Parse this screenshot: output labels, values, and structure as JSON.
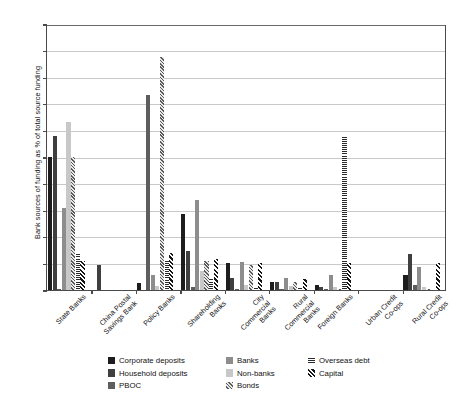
{
  "chart_data": {
    "type": "bar",
    "title": "",
    "xlabel": "",
    "ylabel": "Bank sources of funding as % of total source funding",
    "ylim": [
      0,
      10
    ],
    "yticks": [
      0,
      1,
      2,
      3,
      4,
      5,
      6,
      7,
      8,
      9,
      10
    ],
    "ytick_labels": [
      "0",
      "1",
      "2",
      "3",
      "4",
      "5",
      "6",
      "7",
      "8",
      "9",
      "10"
    ],
    "grid": true,
    "legend_position": "bottom",
    "categories": [
      "State Banks",
      "China Postal Savings Bank",
      "Policy Banks",
      "Shareholding Banks",
      "City Commercial Banks",
      "Rural Commercial Banks",
      "Foreign Banks",
      "Urban Credit Co-ops",
      "Rural Credit Co-ops"
    ],
    "series": [
      {
        "name": "Corporate deposits",
        "color": "#1d1d1d",
        "pattern": "solid",
        "values": [
          5.0,
          0.0,
          0.25,
          2.85,
          1.0,
          0.3,
          0.2,
          0.0,
          0.55
        ]
      },
      {
        "name": "Household deposits",
        "color": "#3f3f3f",
        "pattern": "solid",
        "values": [
          5.8,
          0.95,
          0.0,
          1.45,
          0.45,
          0.3,
          0.1,
          0.0,
          1.35
        ]
      },
      {
        "name": "PBOC",
        "color": "#5e5e5e",
        "pattern": "solid",
        "values": [
          0.05,
          0.0,
          7.35,
          0.1,
          0.05,
          0.05,
          0.05,
          0.0,
          0.2
        ]
      },
      {
        "name": "Banks",
        "color": "#8d8d8d",
        "pattern": "solid",
        "values": [
          3.1,
          0.0,
          0.55,
          3.4,
          1.05,
          0.45,
          0.55,
          0.0,
          0.85
        ]
      },
      {
        "name": "Non-banks",
        "color": "#c8c8c8",
        "pattern": "solid",
        "values": [
          6.3,
          0.0,
          0.15,
          0.7,
          0.2,
          0.15,
          0.1,
          0.0,
          0.1
        ]
      },
      {
        "name": "Bonds",
        "color": "#5a5a5a",
        "pattern": "diagonal-stripe",
        "values": [
          5.0,
          0.0,
          8.75,
          1.1,
          0.95,
          0.3,
          0.05,
          0.0,
          0.05
        ]
      },
      {
        "name": "Overseas debt",
        "color": "#2a2a2a",
        "pattern": "horizontal-stripe",
        "values": [
          1.35,
          0.0,
          1.1,
          0.45,
          0.1,
          0.1,
          5.8,
          0.0,
          0.05
        ]
      },
      {
        "name": "Capital",
        "color": "#161616",
        "pattern": "diagonal-stripe-bold",
        "values": [
          1.1,
          0.0,
          1.4,
          1.15,
          1.0,
          0.4,
          1.0,
          0.0,
          1.0
        ]
      }
    ]
  },
  "legend": {
    "columns": [
      [
        "Corporate deposits",
        "Household deposits",
        "PBOC"
      ],
      [
        "Banks",
        "Non-banks",
        "Bonds"
      ],
      [
        "Overseas debt",
        "Capital"
      ]
    ]
  }
}
